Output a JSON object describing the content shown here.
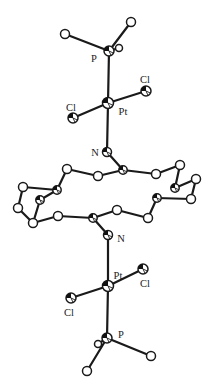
{
  "figure": {
    "background": "#ffffff",
    "stroke_color": "#1a1a1a",
    "atom_fill": "#ffffff",
    "shade_fill": "#111111",
    "width": 214,
    "height": 390,
    "bond_width": 2.2,
    "label_font_size": 10.5,
    "atoms": {
      "PTop": {
        "x": 109,
        "y": 51,
        "r": 5.0,
        "style": "octant"
      },
      "Ca": {
        "x": 65,
        "y": 34,
        "r": 4.5,
        "style": "open"
      },
      "Cb": {
        "x": 131,
        "y": 22,
        "r": 4.5,
        "style": "open"
      },
      "Cc": {
        "x": 119,
        "y": 48,
        "r": 3.5,
        "style": "open"
      },
      "PtTop": {
        "x": 108,
        "y": 103,
        "r": 5.5,
        "style": "octant"
      },
      "ClTR": {
        "x": 146,
        "y": 91,
        "r": 5.0,
        "style": "octant"
      },
      "ClTL": {
        "x": 73,
        "y": 118,
        "r": 5.0,
        "style": "octant"
      },
      "NTop": {
        "x": 107,
        "y": 152,
        "r": 4.5,
        "style": "octant"
      },
      "T1": {
        "x": 67,
        "y": 169,
        "r": 4.5,
        "style": "open"
      },
      "T2": {
        "x": 98,
        "y": 176,
        "r": 4.5,
        "style": "open"
      },
      "T3": {
        "x": 123,
        "y": 170,
        "r": 4.2,
        "style": "octant"
      },
      "T4": {
        "x": 156,
        "y": 174,
        "r": 4.5,
        "style": "open"
      },
      "T5": {
        "x": 180,
        "y": 165,
        "r": 4.5,
        "style": "open"
      },
      "R1": {
        "x": 196,
        "y": 179,
        "r": 4.5,
        "style": "open"
      },
      "R2": {
        "x": 175,
        "y": 188,
        "r": 4.2,
        "style": "octant"
      },
      "R3": {
        "x": 191,
        "y": 199,
        "r": 4.5,
        "style": "open"
      },
      "R4": {
        "x": 157,
        "y": 198,
        "r": 4.2,
        "style": "octant"
      },
      "B1": {
        "x": 148,
        "y": 218,
        "r": 4.5,
        "style": "open"
      },
      "B2": {
        "x": 117,
        "y": 210,
        "r": 4.5,
        "style": "open"
      },
      "B3": {
        "x": 93,
        "y": 218,
        "r": 4.2,
        "style": "octant"
      },
      "B4": {
        "x": 58,
        "y": 216,
        "r": 4.5,
        "style": "open"
      },
      "O1": {
        "x": 33,
        "y": 223,
        "r": 4.5,
        "style": "open"
      },
      "L2": {
        "x": 18,
        "y": 208,
        "r": 4.5,
        "style": "open"
      },
      "L1": {
        "x": 23,
        "y": 187,
        "r": 4.5,
        "style": "open"
      },
      "S1": {
        "x": 57,
        "y": 190,
        "r": 4.2,
        "style": "octant"
      },
      "S2": {
        "x": 40,
        "y": 200,
        "r": 4.2,
        "style": "octant"
      },
      "NBot": {
        "x": 108,
        "y": 235,
        "r": 4.5,
        "style": "octant"
      },
      "PtBot": {
        "x": 108,
        "y": 286,
        "r": 5.5,
        "style": "octant"
      },
      "ClBR": {
        "x": 143,
        "y": 269,
        "r": 5.0,
        "style": "octant"
      },
      "ClBL": {
        "x": 71,
        "y": 298,
        "r": 5.0,
        "style": "octant"
      },
      "PBot": {
        "x": 107,
        "y": 338,
        "r": 5.0,
        "style": "octant"
      },
      "Cd": {
        "x": 98,
        "y": 344,
        "r": 3.5,
        "style": "open"
      },
      "Ce": {
        "x": 87,
        "y": 371,
        "r": 4.5,
        "style": "open"
      },
      "Cf": {
        "x": 151,
        "y": 356,
        "r": 4.5,
        "style": "open"
      }
    },
    "bonds": [
      [
        "PTop",
        "Ca"
      ],
      [
        "PTop",
        "Cb"
      ],
      [
        "PTop",
        "Cc"
      ],
      [
        "PTop",
        "PtTop"
      ],
      [
        "PtTop",
        "ClTR"
      ],
      [
        "PtTop",
        "ClTL"
      ],
      [
        "PtTop",
        "NTop"
      ],
      [
        "NTop",
        "T3"
      ],
      [
        "T1",
        "T2"
      ],
      [
        "T2",
        "T3"
      ],
      [
        "T3",
        "T4"
      ],
      [
        "T4",
        "T5"
      ],
      [
        "T5",
        "R2"
      ],
      [
        "R2",
        "R1"
      ],
      [
        "R1",
        "R3"
      ],
      [
        "R3",
        "R4"
      ],
      [
        "R4",
        "B1"
      ],
      [
        "B1",
        "B2"
      ],
      [
        "B2",
        "B3"
      ],
      [
        "B3",
        "B4"
      ],
      [
        "B4",
        "O1"
      ],
      [
        "O1",
        "L2"
      ],
      [
        "L2",
        "L1"
      ],
      [
        "L1",
        "S1"
      ],
      [
        "S1",
        "T1"
      ],
      [
        "S1",
        "S2"
      ],
      [
        "S2",
        "O1"
      ],
      [
        "NBot",
        "B3"
      ],
      [
        "NBot",
        "PtBot"
      ],
      [
        "PtBot",
        "ClBR"
      ],
      [
        "PtBot",
        "ClBL"
      ],
      [
        "PtBot",
        "PBot"
      ],
      [
        "PBot",
        "Cd"
      ],
      [
        "PBot",
        "Ce"
      ],
      [
        "PBot",
        "Cf"
      ]
    ],
    "labels": [
      {
        "text": "P",
        "x": 94,
        "y": 58,
        "name": "label-p-top"
      },
      {
        "text": "Cl",
        "x": 145,
        "y": 79,
        "name": "label-cl-top-right"
      },
      {
        "text": "Cl",
        "x": 71,
        "y": 107,
        "name": "label-cl-top-left"
      },
      {
        "text": "Pt",
        "x": 123,
        "y": 111,
        "name": "label-pt-top"
      },
      {
        "text": "N",
        "x": 95,
        "y": 152,
        "name": "label-n-top"
      },
      {
        "text": "N",
        "x": 121,
        "y": 238,
        "name": "label-n-bottom"
      },
      {
        "text": "Pt",
        "x": 118,
        "y": 275,
        "name": "label-pt-bottom"
      },
      {
        "text": "Cl",
        "x": 145,
        "y": 283,
        "name": "label-cl-bottom-right"
      },
      {
        "text": "Cl",
        "x": 69,
        "y": 312,
        "name": "label-cl-bottom-left"
      },
      {
        "text": "P",
        "x": 121,
        "y": 334,
        "name": "label-p-bottom"
      }
    ]
  }
}
